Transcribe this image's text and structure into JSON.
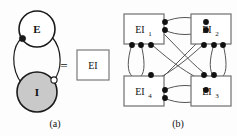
{
  "figure": {
    "background_color": "#fdfdfd",
    "stroke_color": "#1a1a1a",
    "panels": [
      {
        "id": "a",
        "caption": "(a)",
        "nodes": [
          {
            "id": "E",
            "label": "E",
            "shape": "circle",
            "fill": "#ffffff",
            "stroke": "#1a1a1a",
            "cx": 37,
            "cy": 29,
            "r": 18
          },
          {
            "id": "I",
            "label": "I",
            "shape": "circle",
            "fill": "#c9c9c9",
            "stroke": "#1a1a1a",
            "cx": 37,
            "cy": 92,
            "r": 20
          }
        ],
        "edges": [
          {
            "id": "I-to-E",
            "from": "I",
            "to": "E",
            "terminal": "filled-dot",
            "terminal_label": "excitatory-terminal"
          },
          {
            "id": "E-to-I",
            "from": "E",
            "to": "I",
            "terminal": "open-circle",
            "terminal_label": "inhibitory-terminal"
          }
        ],
        "equivalence": {
          "symbol": "=",
          "box_label": "EI",
          "box_fill": "#ffffff",
          "box_stroke": "#7a7a7a"
        }
      },
      {
        "id": "b",
        "caption": "(b)",
        "unit_fill": "#ffffff",
        "unit_stroke": "#6f6f6f",
        "units": [
          {
            "id": "EI1",
            "label": "EI",
            "subscript": "1",
            "position": "top-left",
            "x": 6,
            "y": 14,
            "w": 40,
            "h": 30
          },
          {
            "id": "EI2",
            "label": "EI",
            "subscript": "2",
            "position": "top-right",
            "x": 73,
            "y": 14,
            "w": 40,
            "h": 30
          },
          {
            "id": "EI4",
            "label": "EI",
            "subscript": "4",
            "position": "bottom-left",
            "x": 6,
            "y": 76,
            "w": 40,
            "h": 30
          },
          {
            "id": "EI3",
            "label": "EI",
            "subscript": "3",
            "position": "bottom-right",
            "x": 73,
            "y": 76,
            "w": 40,
            "h": 30
          }
        ],
        "connections": [
          {
            "from": "EI1",
            "to": "EI2",
            "kind": "horizontal-top-pair"
          },
          {
            "from": "EI4",
            "to": "EI3",
            "kind": "horizontal-bottom-pair"
          },
          {
            "from": "EI1",
            "to": "EI4",
            "kind": "vertical-left-pair"
          },
          {
            "from": "EI2",
            "to": "EI3",
            "kind": "vertical-right-pair"
          },
          {
            "from": "EI1",
            "to": "EI3",
            "kind": "diagonal-pair"
          },
          {
            "from": "EI2",
            "to": "EI4",
            "kind": "diagonal-pair"
          }
        ],
        "terminal_marker": "filled-dot"
      }
    ]
  }
}
